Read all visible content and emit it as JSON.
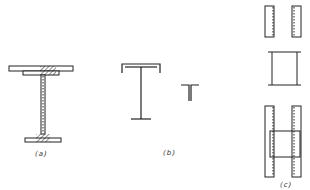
{
  "figure": {
    "panels": [
      {
        "id": "a",
        "label": "(a)",
        "description": "Built-up I-girder with welded cover plate on top flange; hatched welds at flange-web junctions"
      },
      {
        "id": "b",
        "label": "(b)",
        "description": "I-section with channel-shaped top flange, and split T-section"
      },
      {
        "id": "c",
        "label": "(c)",
        "description": "Two plates, rolled I-section, and combined assembly with dashed weld lines"
      }
    ]
  },
  "colors": {
    "stroke": "#222222",
    "background": "#ffffff"
  }
}
